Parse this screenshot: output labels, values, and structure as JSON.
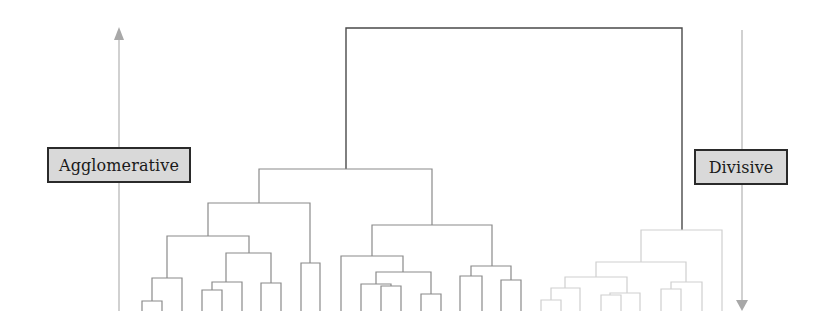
{
  "diagram": {
    "type": "dendrogram",
    "colors": {
      "background": "#ffffff",
      "dark_tree": "#4a4a4a",
      "mid_tree": "#8a8a8a",
      "light_tree": "#cfcfcf",
      "arrow": "#b0b0b0",
      "label_fill": "#d9d9d9",
      "label_border": "#2a2a2a"
    },
    "labels": {
      "agglomerative": {
        "text": "Agglomerative",
        "box": {
          "x": 47,
          "y": 147,
          "w": 144,
          "h": 36
        }
      },
      "divisive": {
        "text": "Divisive",
        "box": {
          "x": 694,
          "y": 149,
          "w": 94,
          "h": 36
        }
      }
    },
    "arrows": {
      "agglomerative": {
        "direction": "up",
        "x": 119,
        "y_top": 27,
        "y_bottom": 311
      },
      "divisive": {
        "direction": "down",
        "x": 742,
        "y_top": 30,
        "y_bottom": 310
      }
    },
    "leaf_baseline_y": 311,
    "root": {
      "join_y": 28,
      "left_x": 346,
      "right_x": 682
    },
    "clusters": [
      {
        "name": "left-cluster",
        "tone": "mid",
        "leaves_x": [
          142,
          162,
          182,
          202,
          222,
          242,
          261,
          281,
          301,
          320
        ]
      },
      {
        "name": "middle-cluster",
        "tone": "mid",
        "leaves_x": [
          341,
          361,
          381,
          401,
          421,
          441,
          460,
          482,
          501,
          521
        ]
      },
      {
        "name": "right-cluster",
        "tone": "light",
        "leaves_x": [
          541,
          561,
          580,
          601,
          621,
          640,
          661,
          681,
          702,
          722
        ]
      }
    ]
  }
}
